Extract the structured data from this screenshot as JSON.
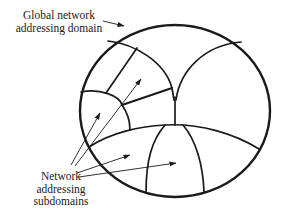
{
  "diagram": {
    "type": "nested-domain-diagram",
    "labels": {
      "global": {
        "line1": "Global network",
        "line2": "addressing domain"
      },
      "subdomains": {
        "line1": "Network",
        "line2": "addressing",
        "line3": "subdomains"
      }
    },
    "colors": {
      "stroke": "#1a1a1a",
      "background": "#ffffff"
    },
    "nodes": [
      {
        "id": "global-domain",
        "label": "Global network addressing domain",
        "shape": "circle"
      },
      {
        "id": "subdomain-left-small",
        "label": "Network addressing subdomain"
      },
      {
        "id": "subdomain-upper-middle",
        "label": "Network addressing subdomain"
      },
      {
        "id": "subdomain-bottom-left",
        "label": "Network addressing subdomain"
      },
      {
        "id": "subdomain-bottom-center",
        "label": "Network addressing subdomain"
      }
    ],
    "edges": [
      {
        "from": "label-global",
        "to": "global-domain",
        "type": "arrow"
      },
      {
        "from": "label-subdomains",
        "to": "subdomain-left-small",
        "type": "arrow"
      },
      {
        "from": "label-subdomains",
        "to": "subdomain-upper-middle",
        "type": "arrow"
      },
      {
        "from": "label-subdomains",
        "to": "subdomain-bottom-left",
        "type": "arrow"
      },
      {
        "from": "label-subdomains",
        "to": "subdomain-bottom-center",
        "type": "arrow"
      }
    ]
  }
}
